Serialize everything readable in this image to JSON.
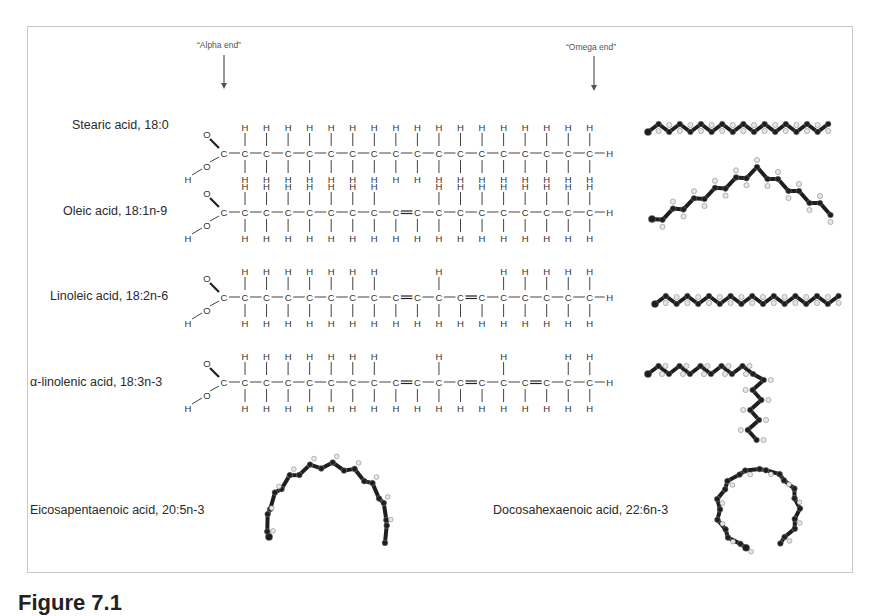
{
  "figure": {
    "annotations": {
      "alpha_end": "“Alpha  end”",
      "omega_end": "“Omega end”"
    },
    "structures": [
      {
        "name": "Stearic acid, 18:0",
        "carbons": 18,
        "double_bonds": []
      },
      {
        "name": "Oleic acid, 18:1n-9",
        "carbons": 18,
        "double_bonds": [
          9
        ]
      },
      {
        "name": "Linoleic acid, 18:2n-6",
        "carbons": 18,
        "double_bonds": [
          9,
          12
        ]
      },
      {
        "name": "α-linolenic acid, 18:3n-3",
        "carbons": 18,
        "double_bonds": [
          9,
          12,
          15
        ]
      }
    ],
    "models": [
      {
        "name": "Eicosapentaenoic acid, 20:5n-3",
        "shape": "arch"
      },
      {
        "name": "Docosahexaenoic acid, 22:6n-3",
        "shape": "ring"
      }
    ],
    "atoms": {
      "carbon": "C",
      "hydrogen": "H",
      "oxygen": "O"
    },
    "caption": "Figure 7.1"
  },
  "colors": {
    "border": "#c8c8c8",
    "text": "#2a2a2a",
    "bond": "#444444",
    "ball_dark": "#1e1e1e",
    "ball_light": "#e6e6e6"
  }
}
